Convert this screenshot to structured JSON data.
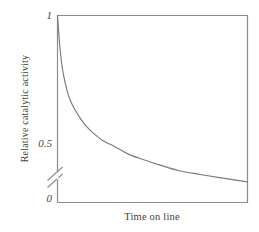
{
  "chart_data": {
    "type": "line",
    "title": "",
    "subtitle": "",
    "xlabel": "Time on line",
    "ylabel": "Relative catalytic activity",
    "x_tick_labels": [],
    "y_tick_labels": [
      "0",
      "0.5",
      "1"
    ],
    "ylim": [
      0,
      1
    ],
    "xlim": [
      0,
      1
    ],
    "grid": false,
    "legend": null,
    "axis_break": {
      "axis": "y",
      "present": true,
      "style": "double-slash",
      "between": [
        0,
        0.5
      ],
      "note": "broken axis marker on y-axis below the 0.5 label"
    },
    "annotations": [],
    "series": [
      {
        "name": "Relative catalytic activity",
        "color": "#7a7a7a",
        "x": [
          0.0,
          0.01,
          0.02,
          0.03,
          0.05,
          0.07,
          0.09,
          0.12,
          0.15,
          0.19,
          0.24,
          0.3,
          0.37,
          0.45,
          0.54,
          0.64,
          0.75,
          0.87,
          1.0
        ],
        "values": [
          1.0,
          0.86,
          0.76,
          0.69,
          0.6,
          0.54,
          0.5,
          0.45,
          0.41,
          0.37,
          0.33,
          0.3,
          0.26,
          0.23,
          0.2,
          0.17,
          0.15,
          0.13,
          0.11
        ]
      }
    ]
  },
  "axis": {
    "tick_1": "1",
    "tick_05": "0.5",
    "tick_0": "0",
    "x_title": "Time on line",
    "y_title": "Relative catalytic activity"
  },
  "colors": {
    "background": "#ffffff",
    "frame": "#8c8c8c",
    "curve": "#787878",
    "text": "#3f3f3f"
  }
}
